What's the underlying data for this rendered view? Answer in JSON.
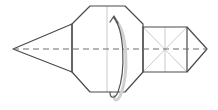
{
  "diagram": {
    "type": "origami-fold-step",
    "width": 218,
    "height": 110,
    "colors": {
      "outline": "#4a4a4a",
      "crease": "#bdbdbd",
      "valley_fold": "#6e6e6e",
      "arrow": "#555555",
      "arrow_shadow": "#d0d0d0",
      "background": "#ffffff"
    },
    "shapes": {
      "left_triangle": "13,49 72,24 72,72",
      "center_octagon": "72,24 90,6 125,6 143,24 143,72 125,92 90,92 72,72",
      "right_square": "143,27 187,27 187,72 143,72",
      "right_point": "187,27 207,49 187,72"
    },
    "creases": [
      {
        "x1": 107,
        "y1": 6,
        "x2": 107,
        "y2": 92,
        "name": "center-vertical-crease"
      },
      {
        "x1": 165,
        "y1": 27,
        "x2": 165,
        "y2": 72,
        "name": "square-vertical-crease"
      },
      {
        "x1": 143,
        "y1": 27,
        "x2": 187,
        "y2": 72,
        "name": "square-diagonal-crease-1"
      },
      {
        "x1": 143,
        "y1": 72,
        "x2": 187,
        "y2": 27,
        "name": "square-diagonal-crease-2"
      }
    ],
    "valley_fold_line": {
      "x1": 13,
      "y1": 49,
      "x2": 207,
      "y2": 49,
      "dash": "6,4"
    },
    "fold_arrow": {
      "path": "M 114 18 C 124 30, 126 70, 118 92 C 115 99, 110 99, 110 92",
      "shadow_path": "M 117 22 C 127 34, 129 72, 121 94 C 118 101, 114 102, 114 96",
      "direction": "fold bottom half up behind (mountain fold along horizontal axis)"
    }
  }
}
